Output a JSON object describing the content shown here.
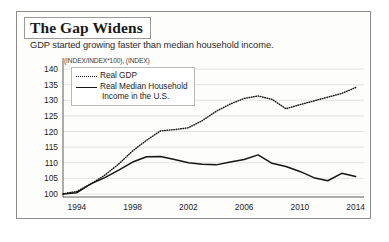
{
  "title": "The Gap Widens",
  "subtitle": "GDP started growing faster than median household income.",
  "unit_note": "(INDEX/INDEX*100), (INDEX)",
  "legend": {
    "gdp_label": "Real GDP",
    "income_label_line1": "Real Median Household",
    "income_label_line2": "Income in the U.S."
  },
  "chart_data": {
    "type": "line",
    "title": "The Gap Widens",
    "subtitle": "GDP started growing faster than median household income.",
    "xlabel": "",
    "ylabel": "(INDEX/INDEX*100), (INDEX)",
    "xlim": [
      1993,
      2014.6
    ],
    "ylim": [
      99,
      141
    ],
    "ytick_labels": [
      "100",
      "105",
      "110",
      "115",
      "120",
      "125",
      "130",
      "135",
      "140"
    ],
    "yticks": [
      100,
      105,
      110,
      115,
      120,
      125,
      130,
      135,
      140
    ],
    "xtick_labels": [
      "1994",
      "1998",
      "2002",
      "2006",
      "2010",
      "2014"
    ],
    "xticks": [
      1994,
      1998,
      2002,
      2006,
      2010,
      2014
    ],
    "grid": "horizontal",
    "legend_position": "upper-left",
    "x": [
      1993,
      1994,
      1995,
      1996,
      1997,
      1998,
      1999,
      2000,
      2001,
      2002,
      2003,
      2004,
      2005,
      2006,
      2007,
      2008,
      2009,
      2010,
      2011,
      2012,
      2013,
      2014
    ],
    "series": [
      {
        "name": "Real GDP",
        "style": "dotted",
        "values": [
          100.0,
          100.8,
          103.2,
          106.0,
          109.6,
          113.8,
          117.2,
          120.2,
          120.6,
          121.2,
          123.5,
          126.5,
          128.8,
          130.6,
          131.4,
          130.3,
          127.3,
          128.6,
          129.8,
          131.0,
          132.2,
          134.1
        ]
      },
      {
        "name": "Real Median Household Income in the U.S.",
        "style": "solid",
        "values": [
          100.0,
          100.4,
          103.2,
          105.2,
          107.6,
          110.2,
          111.9,
          112.0,
          111.0,
          110.0,
          109.5,
          109.3,
          110.2,
          111.0,
          112.5,
          109.8,
          108.8,
          107.2,
          105.2,
          104.2,
          106.6,
          105.6
        ]
      }
    ]
  }
}
